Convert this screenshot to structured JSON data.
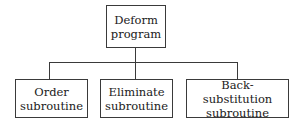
{
  "diagram": {
    "type": "hierarchy-tree",
    "root": {
      "line1": "Deform",
      "line2": "program"
    },
    "children": [
      {
        "line1": "Order",
        "line2": "subroutine"
      },
      {
        "line1": "Eliminate",
        "line2": "subroutine"
      },
      {
        "line1": "Back-substitution",
        "line2": "subroutine"
      }
    ],
    "colors": {
      "line": "#3a3a3a",
      "text": "#1a1a1a",
      "background": "#ffffff"
    }
  }
}
